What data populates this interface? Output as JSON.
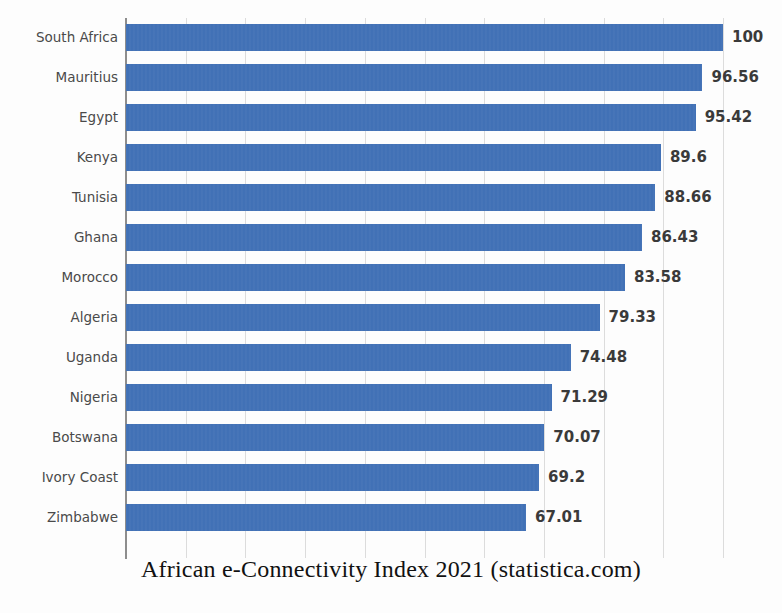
{
  "chart_data": {
    "type": "bar",
    "orientation": "horizontal",
    "title": "African e-Connectivity Index 2021 (statistica.com)",
    "xlabel": "",
    "ylabel": "",
    "xlim": [
      0,
      100
    ],
    "grid": true,
    "legend": false,
    "bar_color": "#3f6fb5",
    "label_color": "#4a4a4a",
    "value_color": "#3a3a3a",
    "categories": [
      "South Africa",
      "Mauritius",
      "Egypt",
      "Kenya",
      "Tunisia",
      "Ghana",
      "Morocco",
      "Algeria",
      "Uganda",
      "Nigeria",
      "Botswana",
      "Ivory Coast",
      "Zimbabwe"
    ],
    "values": [
      100,
      96.56,
      95.42,
      89.6,
      88.66,
      86.43,
      83.58,
      79.33,
      74.48,
      71.29,
      70.07,
      69.2,
      67.01
    ],
    "value_labels": [
      "100",
      "96.56",
      "95.42",
      "89.6",
      "88.66",
      "86.43",
      "83.58",
      "79.33",
      "74.48",
      "71.29",
      "70.07",
      "69.2",
      "67.01"
    ],
    "gridline_values": [
      10,
      20,
      30,
      40,
      50,
      60,
      70,
      80,
      90,
      100
    ]
  },
  "caption": {
    "text": "African e-Connectivity Index 2021 (statistica.com)"
  }
}
